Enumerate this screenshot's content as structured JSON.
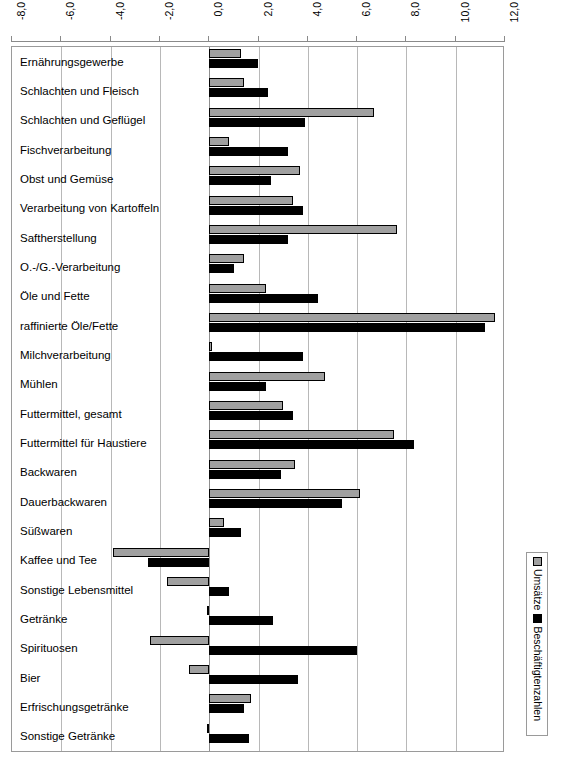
{
  "chart_data": {
    "type": "bar",
    "orientation": "horizontal",
    "title": "",
    "xlabel": "",
    "ylabel": "",
    "xlim": [
      -8.0,
      12.0
    ],
    "xticks": [
      "-8,0",
      "-6,0",
      "-4,0",
      "-2,0",
      "0,0",
      "2,0",
      "4,0",
      "6,0",
      "8,0",
      "10,0",
      "12,0"
    ],
    "xtick_values": [
      -8.0,
      -6.0,
      -4.0,
      -2.0,
      0.0,
      2.0,
      4.0,
      6.0,
      8.0,
      10.0,
      12.0
    ],
    "grid": true,
    "legend_position": "right",
    "categories": [
      "Ernährungsgewerbe",
      "Schlachten und Fleisch",
      "Schlachten und Geflügel",
      "Fischverarbeitung",
      "Obst und Gemüse",
      "Verarbeitung von Kartoffeln",
      "Saftherstellung",
      "O.-/G.-Verarbeitung",
      "Öle und Fette",
      "raffinierte Öle/Fette",
      "Milchverarbeitung",
      "Mühlen",
      "Futtermittel, gesamt",
      "Futtermittel für Haustiere",
      "Backwaren",
      "Dauerbackwaren",
      "Süßwaren",
      "Kaffee und Tee",
      "Sonstige Lebensmittel",
      "Getränke",
      "Spirituosen",
      "Bier",
      "Erfrischungsgetränke",
      "Sonstige Getränke"
    ],
    "series": [
      {
        "name": "Umsätze",
        "color": "#a0a0a0",
        "values": [
          1.3,
          1.4,
          6.7,
          0.8,
          3.7,
          3.4,
          7.6,
          1.4,
          2.3,
          11.6,
          0.1,
          4.7,
          3.0,
          7.5,
          3.5,
          6.1,
          0.6,
          -3.9,
          -1.7,
          -0.1,
          -2.4,
          -0.8,
          1.7,
          -0.1
        ]
      },
      {
        "name": "Beschäftigtenzahlen",
        "color": "#000000",
        "values": [
          2.0,
          2.4,
          3.9,
          3.2,
          2.5,
          3.8,
          3.2,
          1.0,
          4.4,
          11.2,
          3.8,
          2.3,
          3.4,
          8.3,
          2.9,
          5.4,
          1.3,
          -2.5,
          0.8,
          2.6,
          6.0,
          3.6,
          1.4,
          1.6
        ]
      }
    ]
  },
  "legend": {
    "entries": [
      {
        "label": "Umsätze",
        "swatch": "gray"
      },
      {
        "label": "Beschäftigtenzahlen",
        "swatch": "black"
      }
    ]
  }
}
